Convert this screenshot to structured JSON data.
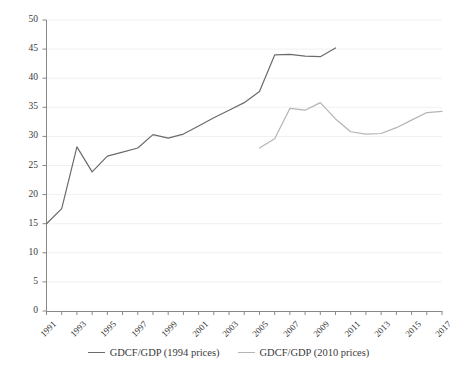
{
  "chart_data": {
    "type": "line",
    "title": "",
    "xlabel": "",
    "ylabel": "Percent",
    "ylim": [
      0,
      50
    ],
    "ytick_step": 5,
    "yticks": [
      "0",
      "5",
      "10",
      "15",
      "20",
      "25",
      "30",
      "35",
      "40",
      "45",
      "50"
    ],
    "xlim": [
      1991,
      2017
    ],
    "xticks": [
      "1991",
      "1993",
      "1995",
      "1997",
      "1999",
      "2001",
      "2003",
      "2005",
      "2007",
      "2009",
      "2011",
      "2013",
      "2015",
      "2017"
    ],
    "x_minor_ticks_every": 1,
    "grid": "horizontal-light",
    "legend_position": "bottom-center",
    "series": [
      {
        "name": "GDCF/GDP (1994 prices)",
        "color": "#6b6b6b",
        "x": [
          1991,
          1992,
          1993,
          1994,
          1995,
          1996,
          1997,
          1998,
          1999,
          2000,
          2001,
          2002,
          2003,
          2004,
          2005,
          2006,
          2007,
          2008,
          2009,
          2010
        ],
        "values": [
          15.0,
          17.6,
          28.2,
          23.9,
          26.6,
          27.3,
          28.0,
          30.3,
          29.7,
          30.4,
          31.8,
          33.2,
          34.5,
          35.8,
          37.7,
          44.0,
          44.1,
          43.8,
          43.7,
          45.2
        ]
      },
      {
        "name": "GDCF/GDP (2010 prices)",
        "color": "#b4b4b4",
        "x": [
          2005,
          2006,
          2007,
          2008,
          2009,
          2010,
          2011,
          2012,
          2013,
          2014,
          2015,
          2016,
          2017
        ],
        "values": [
          28.0,
          29.6,
          34.8,
          34.5,
          35.8,
          33.0,
          30.8,
          30.4,
          30.5,
          31.5,
          32.8,
          34.1,
          34.3
        ]
      }
    ]
  },
  "legend": [
    {
      "label": "GDCF/GDP (1994 prices)",
      "color": "#6b6b6b"
    },
    {
      "label": "GDCF/GDP (2010 prices)",
      "color": "#b4b4b4"
    }
  ],
  "axis": {
    "y_title": "Percent"
  }
}
